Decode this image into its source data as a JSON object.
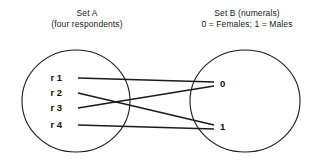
{
  "diagram": {
    "type": "set-mapping-venn",
    "set_a": {
      "title": "Set A",
      "subtitle": "(four respondents)",
      "elements": [
        {
          "label": "r 1",
          "x": 62,
          "y": 81
        },
        {
          "label": "r 2",
          "x": 62,
          "y": 96
        },
        {
          "label": "r 3",
          "x": 62,
          "y": 111
        },
        {
          "label": "r 4",
          "x": 62,
          "y": 128
        }
      ],
      "ellipse": {
        "cx": 76,
        "cy": 101,
        "rx": 54,
        "ry": 51
      }
    },
    "set_b": {
      "title": "Set B (numerals)",
      "subtitle": "0 = Females; 1 = Males",
      "elements": [
        {
          "label": "0",
          "x": 220,
          "y": 87
        },
        {
          "label": "1",
          "x": 220,
          "y": 130
        }
      ],
      "ellipse": {
        "cx": 245,
        "cy": 101,
        "rx": 55,
        "ry": 51
      }
    },
    "mappings": [
      {
        "from": "r 1",
        "to": "0",
        "x1": 78,
        "y1": 78,
        "x2": 214,
        "y2": 82
      },
      {
        "from": "r 2",
        "to": "1",
        "x1": 78,
        "y1": 93,
        "x2": 214,
        "y2": 125
      },
      {
        "from": "r 3",
        "to": "0",
        "x1": 78,
        "y1": 108,
        "x2": 214,
        "y2": 86
      },
      {
        "from": "r 4",
        "to": "1",
        "x1": 78,
        "y1": 125,
        "x2": 214,
        "y2": 129
      }
    ],
    "colors": {
      "stroke": "#1a1a1a",
      "text": "#111111",
      "background": "#ffffff"
    }
  }
}
